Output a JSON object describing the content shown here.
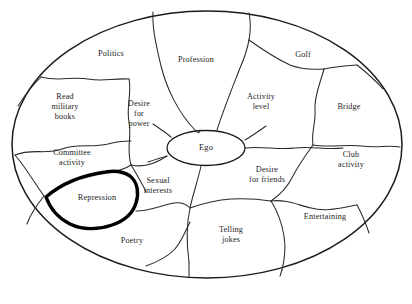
{
  "figure": {
    "type": "concept-diagram",
    "shape": "ellipse",
    "center_label": "Ego",
    "highlight_label": "Repression",
    "highlight_style": "bold-outline",
    "background_color": "#ffffff",
    "line_color": "#2a2a2a",
    "highlight_color": "#000000"
  },
  "center": {
    "label": "Ego"
  },
  "regions": [
    {
      "id": "politics",
      "label": "Politics",
      "x": 111,
      "y": 54,
      "bold": false
    },
    {
      "id": "profession",
      "label": "Profession",
      "x": 196,
      "y": 60,
      "bold": false
    },
    {
      "id": "golf",
      "label": "Golf",
      "x": 303,
      "y": 55,
      "bold": false
    },
    {
      "id": "read-military-books",
      "label": "Read\nmilitary\nbooks",
      "x": 65,
      "y": 107,
      "bold": false
    },
    {
      "id": "desire-for-power",
      "label": "Desire\nfor\npower",
      "x": 139,
      "y": 114,
      "bold": false
    },
    {
      "id": "activity-level",
      "label": "Activity\nlevel",
      "x": 261,
      "y": 102,
      "bold": false
    },
    {
      "id": "bridge",
      "label": "Bridge",
      "x": 349,
      "y": 107,
      "bold": false
    },
    {
      "id": "committee-activity",
      "label": "Committee\nactivity",
      "x": 72,
      "y": 158,
      "bold": false
    },
    {
      "id": "desire-for-friends",
      "label": "Desire\nfor friends",
      "x": 267,
      "y": 175,
      "bold": false
    },
    {
      "id": "club-activity",
      "label": "Club\nactivity",
      "x": 351,
      "y": 160,
      "bold": false
    },
    {
      "id": "repression",
      "label": "Repression",
      "x": 97,
      "y": 198,
      "bold": true
    },
    {
      "id": "sexual-interests",
      "label": "Sexual\ninterests",
      "x": 158,
      "y": 186,
      "bold": false
    },
    {
      "id": "entertaining",
      "label": "Entertaining",
      "x": 325,
      "y": 217,
      "bold": false
    },
    {
      "id": "poetry",
      "label": "Poetry",
      "x": 132,
      "y": 241,
      "bold": false
    },
    {
      "id": "telling-jokes",
      "label": "Telling\njokes",
      "x": 231,
      "y": 235,
      "bold": false
    }
  ]
}
